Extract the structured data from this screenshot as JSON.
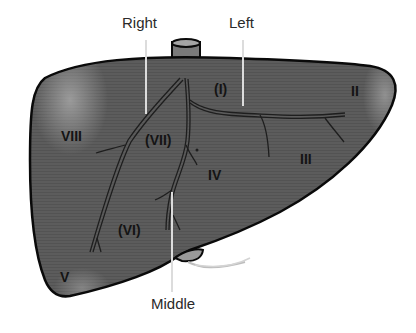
{
  "diagram": {
    "colors": {
      "liver_fill": "#5a5a5a",
      "liver_highlight": "#9a9a9a",
      "outline": "#0a0a0a",
      "vessel": "#1e1e1e",
      "callout_line": "#dcdcdc",
      "label_text": "#141414"
    },
    "callouts": [
      {
        "id": "right",
        "label": "Right",
        "meaning": "Right hepatic vein"
      },
      {
        "id": "left",
        "label": "Left",
        "meaning": "Left hepatic vein"
      },
      {
        "id": "middle",
        "label": "Middle",
        "meaning": "Middle hepatic vein"
      }
    ],
    "segments": [
      {
        "id": "I",
        "label": "(I)"
      },
      {
        "id": "II",
        "label": "II"
      },
      {
        "id": "III",
        "label": "III"
      },
      {
        "id": "IV",
        "label": "IV"
      },
      {
        "id": "V",
        "label": "V"
      },
      {
        "id": "VI",
        "label": "(VI)"
      },
      {
        "id": "VII",
        "label": "(VII)"
      },
      {
        "id": "VIII",
        "label": "VIII"
      }
    ],
    "structures": [
      {
        "id": "ivc",
        "name": "inferior-vena-cava-stub"
      },
      {
        "id": "gallbladder",
        "name": "gallbladder-tip"
      }
    ]
  }
}
